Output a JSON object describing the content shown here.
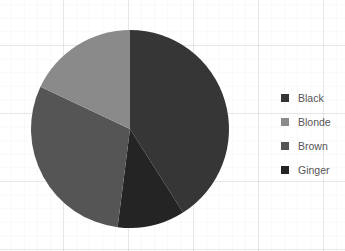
{
  "chart_data": {
    "type": "pie",
    "title": "",
    "categories": [
      "Black",
      "Blonde",
      "Brown",
      "Ginger"
    ],
    "values": [
      41,
      18,
      30,
      11
    ],
    "unit": "percent (estimated from slice angles)",
    "colors": {
      "Black": "#363636",
      "Blonde": "#8a8a8a",
      "Brown": "#555555",
      "Ginger": "#242424"
    },
    "slice_order_clockwise_from_top": [
      "Black",
      "Ginger",
      "Brown",
      "Blonde"
    ],
    "legend_position": "right",
    "grid": true
  },
  "legend": {
    "items": [
      {
        "label": "Black",
        "color": "#363636"
      },
      {
        "label": "Blonde",
        "color": "#8a8a8a"
      },
      {
        "label": "Brown",
        "color": "#555555"
      },
      {
        "label": "Ginger",
        "color": "#242424"
      }
    ]
  }
}
